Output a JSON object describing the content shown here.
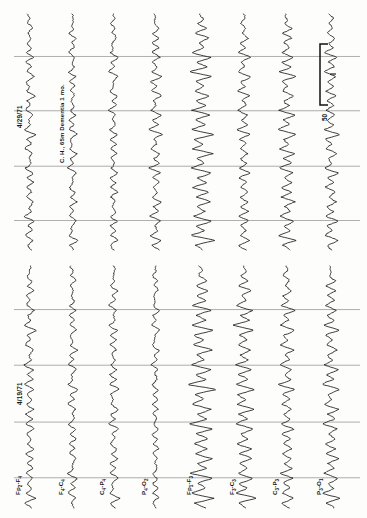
{
  "figure": {
    "kind": "eeg-chart-recording",
    "orientation": "rotated-90",
    "background_color": "#fdfdfc",
    "trace_color": "#1c1c1c",
    "gridline_color": "#8d8d8d"
  },
  "panels": [
    {
      "id": "panel-right",
      "date_label": "4/29/71",
      "annotation": "C. H., 65m  Dementia 1 mo.",
      "has_calibration": true
    },
    {
      "id": "panel-left",
      "date_label": "4/19/71",
      "annotation": "",
      "has_calibration": false
    }
  ],
  "calibration": {
    "value_label": "50",
    "unit_tick_label": "1"
  },
  "channels": [
    {
      "index": 0,
      "label": "Fp2-F4",
      "base": "Fp",
      "sub1": "2",
      "mid": "-F",
      "sub2": "4"
    },
    {
      "index": 1,
      "label": "F4-C4",
      "base": "F",
      "sub1": "4",
      "mid": "-C",
      "sub2": "4"
    },
    {
      "index": 2,
      "label": "C4-P4",
      "base": "C",
      "sub1": "4",
      "mid": "-P",
      "sub2": "4"
    },
    {
      "index": 3,
      "label": "P4-O2",
      "base": "P",
      "sub1": "4",
      "mid": "-O",
      "sub2": "2"
    },
    {
      "index": 4,
      "label": "Fp1-F3",
      "base": "Fp",
      "sub1": "1",
      "mid": "-F",
      "sub2": "3"
    },
    {
      "index": 5,
      "label": "F3-C3",
      "base": "F",
      "sub1": "3",
      "mid": "-C",
      "sub2": "3"
    },
    {
      "index": 6,
      "label": "C3-P3",
      "base": "C",
      "sub1": "3",
      "mid": "-P",
      "sub2": "3"
    },
    {
      "index": 7,
      "label": "P3-O1",
      "base": "P",
      "sub1": "3",
      "mid": "-O",
      "sub2": "1"
    }
  ],
  "chart_data": {
    "type": "line",
    "title": "",
    "subtitle": "",
    "xlabel": "",
    "ylabel": "",
    "grid": true,
    "legend_position": "none",
    "note": "Eight-channel bipolar EEG montage, two recording sessions side by side; image rotated 90 degrees so time runs vertically (bottom to top) and channels are stacked left to right.",
    "axis_ranges": {
      "time_s": [
        0,
        10
      ],
      "amplitude_uV": [
        -80,
        80
      ]
    },
    "calibration_bar_uV": 50,
    "series": [
      {
        "name": "4/29/71 Fp2-F4",
        "panel": "panel-right",
        "channel": "Fp2-F4",
        "values": [
          0,
          4,
          -3,
          9,
          -6,
          12,
          -4,
          6,
          -10,
          14,
          -5,
          8,
          -12,
          18,
          -7,
          5,
          -9,
          16,
          -4,
          7,
          -11,
          13,
          -6,
          9,
          -14,
          20,
          -8,
          6,
          -10,
          15,
          -5,
          8,
          -13,
          17,
          -6,
          10,
          -9,
          12,
          -7,
          14,
          -4,
          9,
          -11,
          16,
          -5,
          7,
          -12,
          19,
          -8,
          6
        ]
      },
      {
        "name": "4/29/71 F4-C4",
        "panel": "panel-right",
        "channel": "F4-C4",
        "values": [
          0,
          3,
          -4,
          7,
          -5,
          10,
          -3,
          5,
          -8,
          12,
          -4,
          6,
          -10,
          15,
          -6,
          4,
          -7,
          13,
          -3,
          6,
          -9,
          11,
          -5,
          7,
          -12,
          17,
          -7,
          5,
          -8,
          12,
          -4,
          7,
          -11,
          14,
          -5,
          8,
          -7,
          10,
          -6,
          12,
          -3,
          7,
          -9,
          13,
          -4,
          6,
          -10,
          16,
          -7,
          5
        ]
      },
      {
        "name": "4/29/71 C4-P4",
        "panel": "panel-right",
        "channel": "C4-P4",
        "values": [
          0,
          5,
          -4,
          8,
          -6,
          11,
          -4,
          6,
          -9,
          13,
          -5,
          7,
          -11,
          16,
          -6,
          5,
          -8,
          14,
          -4,
          7,
          -10,
          12,
          -6,
          8,
          -13,
          18,
          -7,
          6,
          -9,
          14,
          -5,
          7,
          -12,
          16,
          -6,
          9,
          -8,
          11,
          -7,
          13,
          -4,
          8,
          -10,
          15,
          -5,
          7,
          -11,
          17,
          -7,
          6
        ]
      },
      {
        "name": "4/29/71 P4-O2",
        "panel": "panel-right",
        "channel": "P4-O2",
        "values": [
          0,
          6,
          -5,
          11,
          -8,
          15,
          -6,
          9,
          -13,
          19,
          -7,
          11,
          -16,
          23,
          -9,
          7,
          -12,
          20,
          -6,
          10,
          -14,
          17,
          -8,
          12,
          -18,
          25,
          -10,
          8,
          -13,
          19,
          -7,
          11,
          -16,
          21,
          -8,
          13,
          -11,
          15,
          -9,
          18,
          -6,
          12,
          -14,
          20,
          -7,
          10,
          -15,
          24,
          -10,
          8
        ]
      },
      {
        "name": "4/29/71 Fp1-F3",
        "panel": "panel-right",
        "channel": "Fp1-F3",
        "values": [
          0,
          9,
          -8,
          22,
          -14,
          30,
          -10,
          16,
          -26,
          38,
          -12,
          20,
          -32,
          44,
          -16,
          12,
          -22,
          36,
          -10,
          18,
          -28,
          33,
          -14,
          22,
          -36,
          48,
          -18,
          14,
          -24,
          37,
          -12,
          20,
          -30,
          40,
          -14,
          24,
          -20,
          28,
          -16,
          34,
          -10,
          22,
          -26,
          38,
          -12,
          18,
          -28,
          46,
          -18,
          14
        ]
      },
      {
        "name": "4/29/71 F3-C3",
        "panel": "panel-right",
        "channel": "F3-C3",
        "values": [
          0,
          5,
          -5,
          12,
          -8,
          17,
          -6,
          9,
          -14,
          21,
          -7,
          11,
          -18,
          25,
          -9,
          7,
          -13,
          22,
          -6,
          10,
          -16,
          19,
          -8,
          13,
          -20,
          27,
          -11,
          8,
          -14,
          21,
          -7,
          12,
          -17,
          23,
          -9,
          14,
          -12,
          17,
          -10,
          20,
          -7,
          13,
          -15,
          22,
          -8,
          11,
          -16,
          26,
          -11,
          9
        ]
      },
      {
        "name": "4/29/71 C3-P3",
        "panel": "panel-right",
        "channel": "C3-P3",
        "values": [
          0,
          7,
          -6,
          16,
          -10,
          22,
          -8,
          12,
          -18,
          28,
          -9,
          15,
          -24,
          33,
          -12,
          9,
          -17,
          27,
          -8,
          13,
          -21,
          25,
          -10,
          16,
          -27,
          36,
          -13,
          11,
          -18,
          28,
          -9,
          15,
          -23,
          30,
          -11,
          18,
          -16,
          22,
          -12,
          26,
          -8,
          17,
          -20,
          28,
          -9,
          14,
          -21,
          34,
          -13,
          11
        ]
      },
      {
        "name": "4/29/71 P3-O1",
        "panel": "panel-right",
        "channel": "P3-O1",
        "values": [
          0,
          6,
          -5,
          13,
          -9,
          18,
          -7,
          10,
          -15,
          23,
          -8,
          12,
          -20,
          27,
          -10,
          8,
          -14,
          23,
          -7,
          11,
          -17,
          21,
          -9,
          14,
          -22,
          30,
          -12,
          9,
          -15,
          23,
          -8,
          13,
          -19,
          25,
          -10,
          15,
          -13,
          19,
          -11,
          22,
          -7,
          14,
          -17,
          24,
          -8,
          12,
          -18,
          28,
          -12,
          10
        ]
      },
      {
        "name": "4/19/71 Fp2-F4",
        "panel": "panel-left",
        "channel": "Fp2-F4",
        "values": [
          0,
          5,
          -4,
          10,
          -7,
          13,
          -5,
          7,
          -11,
          16,
          -6,
          9,
          -14,
          20,
          -8,
          6,
          -10,
          17,
          -5,
          8,
          -13,
          15,
          -7,
          10,
          -16,
          22,
          -9,
          7,
          -11,
          17,
          -6,
          9,
          -15,
          19,
          -7,
          11,
          -10,
          14,
          -8,
          16,
          -5,
          10,
          -13,
          18,
          -6,
          8,
          -14,
          21,
          -9,
          7
        ]
      },
      {
        "name": "4/19/71 F4-C4",
        "panel": "panel-left",
        "channel": "F4-C4",
        "values": [
          0,
          4,
          -3,
          8,
          -6,
          11,
          -4,
          6,
          -9,
          13,
          -5,
          7,
          -11,
          16,
          -6,
          5,
          -8,
          14,
          -4,
          7,
          -10,
          13,
          -6,
          8,
          -13,
          18,
          -7,
          6,
          -9,
          14,
          -5,
          8,
          -12,
          16,
          -6,
          9,
          -8,
          12,
          -7,
          13,
          -4,
          8,
          -11,
          15,
          -5,
          7,
          -11,
          17,
          -7,
          6
        ]
      },
      {
        "name": "4/19/71 C4-P4",
        "panel": "panel-left",
        "channel": "C4-P4",
        "values": [
          0,
          4,
          -4,
          9,
          -6,
          12,
          -4,
          6,
          -10,
          14,
          -5,
          8,
          -12,
          17,
          -7,
          5,
          -9,
          15,
          -4,
          7,
          -11,
          14,
          -6,
          9,
          -14,
          19,
          -8,
          6,
          -10,
          15,
          -5,
          8,
          -13,
          17,
          -6,
          10,
          -9,
          13,
          -7,
          14,
          -4,
          9,
          -12,
          16,
          -5,
          7,
          -12,
          18,
          -8,
          6
        ]
      },
      {
        "name": "4/19/71 P4-O2",
        "panel": "panel-left",
        "channel": "P4-O2",
        "values": [
          0,
          3,
          -3,
          7,
          -5,
          9,
          -3,
          5,
          -8,
          11,
          -4,
          6,
          -9,
          13,
          -5,
          4,
          -7,
          12,
          -3,
          5,
          -8,
          11,
          -5,
          7,
          -11,
          15,
          -6,
          5,
          -7,
          11,
          -4,
          6,
          -10,
          13,
          -5,
          7,
          -6,
          9,
          -5,
          11,
          -3,
          6,
          -9,
          12,
          -4,
          6,
          -9,
          14,
          -6,
          5
        ]
      },
      {
        "name": "4/19/71 Fp1-F3",
        "panel": "panel-left",
        "channel": "Fp1-F3",
        "values": [
          0,
          10,
          -9,
          24,
          -15,
          33,
          -11,
          17,
          -28,
          42,
          -13,
          22,
          -35,
          48,
          -17,
          13,
          -24,
          39,
          -11,
          19,
          -31,
          36,
          -15,
          24,
          -39,
          52,
          -20,
          15,
          -26,
          40,
          -13,
          22,
          -33,
          44,
          -15,
          26,
          -22,
          31,
          -17,
          37,
          -11,
          24,
          -28,
          41,
          -13,
          20,
          -30,
          50,
          -20,
          15
        ]
      },
      {
        "name": "4/19/71 F3-C3",
        "panel": "panel-left",
        "channel": "F3-C3",
        "values": [
          0,
          8,
          -7,
          19,
          -12,
          26,
          -9,
          14,
          -22,
          33,
          -11,
          18,
          -28,
          38,
          -14,
          11,
          -19,
          31,
          -9,
          15,
          -25,
          29,
          -12,
          19,
          -31,
          41,
          -16,
          12,
          -21,
          32,
          -11,
          17,
          -26,
          35,
          -12,
          21,
          -18,
          25,
          -14,
          30,
          -9,
          19,
          -23,
          33,
          -11,
          16,
          -24,
          40,
          -16,
          12
        ]
      },
      {
        "name": "4/19/71 C3-P3",
        "panel": "panel-left",
        "channel": "C3-P3",
        "values": [
          0,
          6,
          -5,
          14,
          -9,
          19,
          -7,
          11,
          -16,
          25,
          -8,
          13,
          -21,
          29,
          -11,
          8,
          -15,
          24,
          -7,
          12,
          -18,
          22,
          -9,
          14,
          -24,
          32,
          -12,
          10,
          -16,
          25,
          -8,
          13,
          -20,
          27,
          -10,
          16,
          -14,
          20,
          -11,
          23,
          -7,
          15,
          -18,
          25,
          -8,
          12,
          -19,
          31,
          -12,
          10
        ]
      },
      {
        "name": "4/19/71 P3-O1",
        "panel": "panel-left",
        "channel": "P3-O1",
        "values": [
          0,
          7,
          -6,
          15,
          -10,
          21,
          -8,
          12,
          -18,
          27,
          -9,
          14,
          -23,
          31,
          -12,
          9,
          -16,
          26,
          -8,
          13,
          -20,
          24,
          -10,
          15,
          -26,
          34,
          -13,
          10,
          -17,
          27,
          -9,
          14,
          -22,
          29,
          -11,
          17,
          -15,
          21,
          -12,
          25,
          -8,
          16,
          -19,
          27,
          -9,
          13,
          -20,
          33,
          -13,
          11
        ]
      }
    ]
  }
}
